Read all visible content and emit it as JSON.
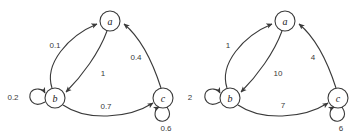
{
  "figure": {
    "type": "directed-weighted-graph-pair",
    "background_color": "#ffffff",
    "stroke_color": "#3a3a3a"
  },
  "graphs": [
    {
      "id": "left-graph",
      "name": "probability-weighted-graph",
      "nodes": [
        {
          "id": "a",
          "label": "a",
          "cx": 110,
          "cy": 21,
          "r": 10
        },
        {
          "id": "b",
          "label": "b",
          "cx": 55,
          "cy": 98,
          "r": 10
        },
        {
          "id": "c",
          "label": "c",
          "cx": 163,
          "cy": 98,
          "r": 10
        }
      ],
      "edges": [
        {
          "from": "b",
          "to": "a",
          "label": "0.1",
          "label_x": 55,
          "label_y": 45
        },
        {
          "from": "a",
          "to": "b",
          "label": "1",
          "label_x": 103,
          "label_y": 73
        },
        {
          "from": "c",
          "to": "a",
          "label": "0.4",
          "label_x": 136,
          "label_y": 57
        },
        {
          "from": "b",
          "to": "c",
          "label": "0.7",
          "label_x": 106,
          "label_y": 106
        },
        {
          "from": "b",
          "to": "b",
          "label": "0.2",
          "label_x": 13,
          "label_y": 97,
          "self_loop": true
        },
        {
          "from": "c",
          "to": "c",
          "label": "0.6",
          "label_x": 166,
          "label_y": 128,
          "self_loop": true
        }
      ]
    },
    {
      "id": "right-graph",
      "name": "integer-weighted-graph",
      "nodes": [
        {
          "id": "a",
          "label": "a",
          "cx": 285,
          "cy": 21,
          "r": 10
        },
        {
          "id": "b",
          "label": "b",
          "cx": 230,
          "cy": 98,
          "r": 10
        },
        {
          "id": "c",
          "label": "c",
          "cx": 338,
          "cy": 98,
          "r": 10
        }
      ],
      "edges": [
        {
          "from": "b",
          "to": "a",
          "label": "1",
          "label_x": 228,
          "label_y": 45
        },
        {
          "from": "a",
          "to": "b",
          "label": "10",
          "label_x": 278,
          "label_y": 73
        },
        {
          "from": "c",
          "to": "a",
          "label": "4",
          "label_x": 313,
          "label_y": 57
        },
        {
          "from": "b",
          "to": "c",
          "label": "7",
          "label_x": 283,
          "label_y": 105
        },
        {
          "from": "b",
          "to": "b",
          "label": "2",
          "label_x": 190,
          "label_y": 97,
          "self_loop": true
        },
        {
          "from": "c",
          "to": "c",
          "label": "6",
          "label_x": 341,
          "label_y": 128,
          "self_loop": true
        }
      ]
    }
  ]
}
